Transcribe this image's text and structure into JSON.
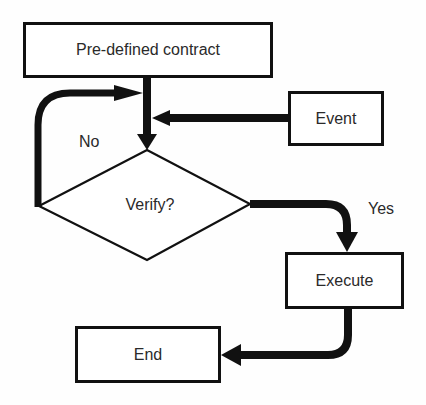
{
  "diagram": {
    "type": "flowchart",
    "nodes": {
      "contract": {
        "label": "Pre-defined contract",
        "shape": "rectangle"
      },
      "event": {
        "label": "Event",
        "shape": "rectangle"
      },
      "verify": {
        "label": "Verify?",
        "shape": "diamond"
      },
      "execute": {
        "label": "Execute",
        "shape": "rectangle"
      },
      "end": {
        "label": "End",
        "shape": "rectangle"
      }
    },
    "edges": [
      {
        "from": "contract",
        "to": "verify",
        "label": ""
      },
      {
        "from": "event",
        "to": "verify",
        "label": ""
      },
      {
        "from": "verify",
        "to": "contract",
        "label": "No"
      },
      {
        "from": "verify",
        "to": "execute",
        "label": "Yes"
      },
      {
        "from": "execute",
        "to": "end",
        "label": ""
      }
    ],
    "edge_labels": {
      "no": "No",
      "yes": "Yes"
    },
    "colors": {
      "stroke": "#111111",
      "background": "#ffffff",
      "text": "#2a2a2a"
    }
  }
}
